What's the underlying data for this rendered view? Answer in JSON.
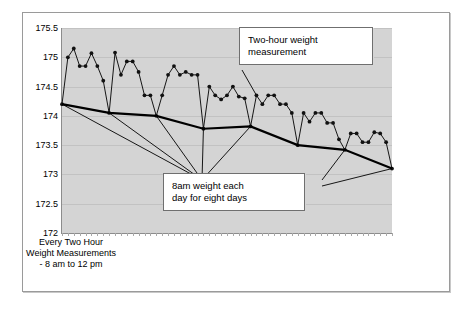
{
  "chart_data": {
    "type": "line",
    "title": "",
    "xlabel": "Every Two Hour Weight Measurements - 8 am to 12 pm",
    "ylabel": "",
    "ylim": [
      172,
      175.5
    ],
    "ytick_labels": [
      "175.5",
      "175",
      "174.5",
      "174",
      "173.5",
      "173",
      "172.5",
      "172"
    ],
    "yticks": [
      175.5,
      175,
      174.5,
      174,
      173.5,
      173,
      172.5,
      172
    ],
    "grid": true,
    "legend": "none",
    "series": [
      {
        "name": "Two-hour weight measurement",
        "style": "line-with-markers",
        "color": "#000000",
        "values": [
          174.2,
          175.0,
          175.15,
          174.85,
          174.85,
          175.07,
          174.85,
          174.6,
          174.05,
          175.08,
          174.7,
          174.93,
          174.93,
          174.75,
          174.35,
          174.35,
          174.0,
          174.35,
          174.7,
          174.85,
          174.7,
          174.75,
          174.7,
          174.7,
          173.78,
          174.5,
          174.35,
          174.28,
          174.35,
          174.5,
          174.33,
          174.3,
          173.82,
          174.35,
          174.2,
          174.35,
          174.35,
          174.2,
          174.2,
          174.05,
          173.5,
          174.05,
          173.9,
          174.05,
          174.05,
          173.88,
          173.88,
          173.6,
          173.42,
          173.7,
          173.7,
          173.55,
          173.55,
          173.72,
          173.7,
          173.55,
          173.1
        ]
      },
      {
        "name": "8am weight each day for eight days",
        "style": "thick-trend-line",
        "color": "#000000",
        "values": [
          174.2,
          174.05,
          174.0,
          173.78,
          173.82,
          173.5,
          173.42,
          173.1
        ]
      }
    ],
    "annotations": [
      {
        "id": "two-hour-weight-measurement",
        "text": "Two-hour weight measurement",
        "lines": [
          "Two-hour weight",
          "measurement"
        ],
        "points_to": "two-hour series"
      },
      {
        "id": "8am-weight-each-day",
        "text": "8am weight each day for eight days",
        "lines": [
          "8am weight each",
          "day for eight days"
        ],
        "points_to": "8am daily low points"
      }
    ],
    "colors": {
      "plot_background": "#d4d4d4",
      "gridline": "#c2c2c2",
      "series": "#000000",
      "annotation_background": "#ffffff",
      "annotation_border": "#6f6f6f"
    }
  }
}
